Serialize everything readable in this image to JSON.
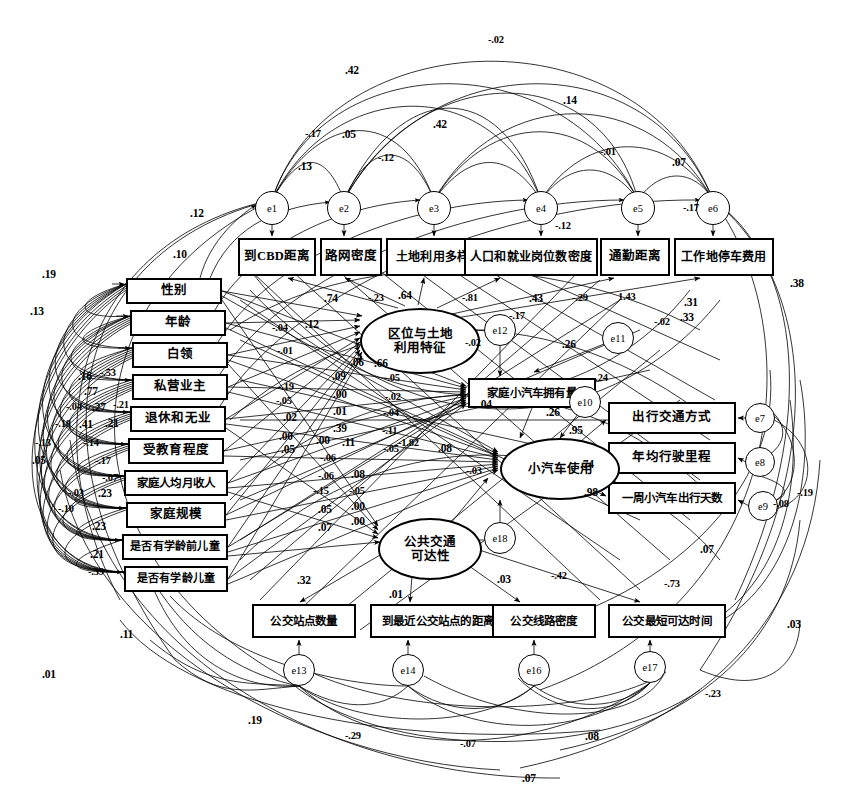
{
  "diagram": {
    "type": "sem-path-diagram",
    "canvas": {
      "width": 845,
      "height": 800
    },
    "stroke_color": "#000000",
    "background_color": "#ffffff"
  },
  "observed_top": [
    {
      "id": "ob1",
      "label": "到CBD距离",
      "x": 238,
      "y": 238,
      "w": 78,
      "h": 38
    },
    {
      "id": "ob2",
      "label": "路网密度",
      "x": 320,
      "y": 238,
      "w": 62,
      "h": 38
    },
    {
      "id": "ob3",
      "label": "土地利用多样性指数",
      "x": 386,
      "y": 238,
      "w": 130,
      "h": 38
    },
    {
      "id": "ob4",
      "label": "人口和就业岗位数密度",
      "x": 464,
      "y": 238,
      "w": 134,
      "h": 38
    },
    {
      "id": "ob5",
      "label": "通勤距离",
      "x": 600,
      "y": 238,
      "w": 70,
      "h": 38
    },
    {
      "id": "ob6",
      "label": "工作地停车费用",
      "x": 674,
      "y": 238,
      "w": 100,
      "h": 38
    }
  ],
  "observed_left": [
    {
      "id": "ol1",
      "label": "性别",
      "x": 126,
      "y": 278,
      "w": 96,
      "h": 26
    },
    {
      "id": "ol2",
      "label": "年龄",
      "x": 130,
      "y": 310,
      "w": 96,
      "h": 26
    },
    {
      "id": "ol3",
      "label": "白领",
      "x": 132,
      "y": 342,
      "w": 96,
      "h": 26
    },
    {
      "id": "ol4",
      "label": "私营业主",
      "x": 132,
      "y": 374,
      "w": 96,
      "h": 26
    },
    {
      "id": "ol5",
      "label": "退休和无业",
      "x": 130,
      "y": 406,
      "w": 96,
      "h": 26
    },
    {
      "id": "ol6",
      "label": "受教育程度",
      "x": 128,
      "y": 438,
      "w": 96,
      "h": 26
    },
    {
      "id": "ol7",
      "label": "家庭人均月收人",
      "x": 124,
      "y": 470,
      "w": 104,
      "h": 26
    },
    {
      "id": "ol8",
      "label": "家庭规模",
      "x": 126,
      "y": 502,
      "w": 100,
      "h": 26
    },
    {
      "id": "ol9",
      "label": "是否有学龄前儿童",
      "x": 122,
      "y": 534,
      "w": 106,
      "h": 26
    },
    {
      "id": "ol10",
      "label": "是否有学龄儿童",
      "x": 124,
      "y": 566,
      "w": 104,
      "h": 26
    }
  ],
  "observed_right": [
    {
      "id": "or1",
      "label": "出行交通方式",
      "x": 608,
      "y": 402,
      "w": 128,
      "h": 32
    },
    {
      "id": "or2",
      "label": "年均行驶里程",
      "x": 608,
      "y": 442,
      "w": 128,
      "h": 32
    },
    {
      "id": "or3",
      "label": "一周小汽车出行天数",
      "x": 608,
      "y": 482,
      "w": 128,
      "h": 32
    }
  ],
  "observed_bottom": [
    {
      "id": "obt1",
      "label": "公交站点数量",
      "x": 252,
      "y": 604,
      "w": 104,
      "h": 34
    },
    {
      "id": "obt2",
      "label": "到最近公交站点的距离",
      "x": 370,
      "y": 604,
      "w": 136,
      "h": 34
    },
    {
      "id": "obt3",
      "label": "公交线路密度",
      "x": 492,
      "y": 604,
      "w": 104,
      "h": 34
    },
    {
      "id": "obt4",
      "label": "公交最短可达时间",
      "x": 608,
      "y": 604,
      "w": 118,
      "h": 34
    }
  ],
  "latents": [
    {
      "id": "lat1",
      "label": "区位与土地\n利用特征",
      "line1": "区位与土地",
      "line2": "利用特征",
      "x": 360,
      "y": 308,
      "w": 120,
      "h": 66
    },
    {
      "id": "lat2",
      "label": "小汽车使用",
      "line1": "小汽车使用",
      "line2": "",
      "x": 500,
      "y": 438,
      "w": 120,
      "h": 62
    },
    {
      "id": "lat3",
      "label": "公共交通\n可达性",
      "line1": "公共交通",
      "line2": "可达性",
      "x": 378,
      "y": 518,
      "w": 104,
      "h": 62
    }
  ],
  "observed_mid": [
    {
      "id": "om1",
      "label": "家庭小汽车拥有量",
      "x": 468,
      "y": 378,
      "w": 128,
      "h": 30
    }
  ],
  "errors": [
    {
      "id": "e1",
      "label": "e1",
      "cx": 272,
      "cy": 208,
      "r": 17
    },
    {
      "id": "e2",
      "label": "e2",
      "cx": 344,
      "cy": 208,
      "r": 17
    },
    {
      "id": "e3",
      "label": "e3",
      "cx": 434,
      "cy": 208,
      "r": 17
    },
    {
      "id": "e4",
      "label": "e4",
      "cx": 541,
      "cy": 208,
      "r": 17
    },
    {
      "id": "e5",
      "label": "e5",
      "cx": 638,
      "cy": 208,
      "r": 17
    },
    {
      "id": "e6",
      "label": "e6",
      "cx": 713,
      "cy": 208,
      "r": 17
    },
    {
      "id": "e7",
      "label": "e7",
      "cx": 760,
      "cy": 418,
      "r": 15
    },
    {
      "id": "e8",
      "label": "e8",
      "cx": 760,
      "cy": 462,
      "r": 15
    },
    {
      "id": "e9",
      "label": "e9",
      "cx": 763,
      "cy": 506,
      "r": 15
    },
    {
      "id": "e10",
      "label": "e10",
      "cx": 585,
      "cy": 402,
      "r": 16
    },
    {
      "id": "e11",
      "label": "e11",
      "cx": 618,
      "cy": 338,
      "r": 16
    },
    {
      "id": "e12",
      "label": "e12",
      "cx": 500,
      "cy": 330,
      "r": 16
    },
    {
      "id": "e13",
      "label": "e13",
      "cx": 299,
      "cy": 670,
      "r": 16
    },
    {
      "id": "e14",
      "label": "e14",
      "cx": 408,
      "cy": 670,
      "r": 16
    },
    {
      "id": "e16",
      "label": "e16",
      "cx": 534,
      "cy": 670,
      "r": 16
    },
    {
      "id": "e17",
      "label": "e17",
      "cx": 650,
      "cy": 667,
      "r": 16
    },
    {
      "id": "e18",
      "label": "e18",
      "cx": 500,
      "cy": 538,
      "r": 16
    }
  ],
  "coefficients": [
    {
      "id": "c_top_n02",
      "value": "-.02",
      "x": 488,
      "y": 34
    },
    {
      "id": "c_top_42a",
      "value": ".42",
      "x": 345,
      "y": 64
    },
    {
      "id": "c_top_14",
      "value": ".14",
      "x": 563,
      "y": 94
    },
    {
      "id": "c_top_n17",
      "value": "-.17",
      "x": 305,
      "y": 128
    },
    {
      "id": "c_top_05",
      "value": ".05",
      "x": 342,
      "y": 128
    },
    {
      "id": "c_top_42b",
      "value": ".42",
      "x": 433,
      "y": 118
    },
    {
      "id": "c_top_n01",
      "value": "-.01",
      "x": 600,
      "y": 146
    },
    {
      "id": "c_top_07",
      "value": ".07",
      "x": 672,
      "y": 156
    },
    {
      "id": "c_top_13",
      "value": ".13",
      "x": 298,
      "y": 160
    },
    {
      "id": "c_top_n12",
      "value": "-.12",
      "x": 378,
      "y": 152
    },
    {
      "id": "c_e6_n17",
      "value": "-.17",
      "x": 683,
      "y": 202
    },
    {
      "id": "c_e4_n12",
      "value": "-.12",
      "x": 555,
      "y": 220
    },
    {
      "id": "c_l_12",
      "value": ".12",
      "x": 190,
      "y": 207
    },
    {
      "id": "c_l_10",
      "value": ".10",
      "x": 173,
      "y": 248
    },
    {
      "id": "c_l_19",
      "value": ".19",
      "x": 42,
      "y": 268
    },
    {
      "id": "c_l_13a",
      "value": ".13",
      "x": 30,
      "y": 305
    },
    {
      "id": "c_r_38",
      "value": ".38",
      "x": 790,
      "y": 277
    },
    {
      "id": "c_r_31",
      "value": ".31",
      "x": 684,
      "y": 296
    },
    {
      "id": "c_r_33",
      "value": ".33",
      "x": 680,
      "y": 311
    },
    {
      "id": "c_74",
      "value": ".74",
      "x": 324,
      "y": 292
    },
    {
      "id": "c_n23",
      "value": "-.23",
      "x": 368,
      "y": 292
    },
    {
      "id": "c_64",
      "value": ".64",
      "x": 398,
      "y": 289
    },
    {
      "id": "c_n81",
      "value": "-.81",
      "x": 462,
      "y": 292
    },
    {
      "id": "c_43",
      "value": ".43",
      "x": 529,
      "y": 292
    },
    {
      "id": "c_n29",
      "value": "-.29",
      "x": 572,
      "y": 292
    },
    {
      "id": "c_143",
      "value": "1.43",
      "x": 618,
      "y": 291
    },
    {
      "id": "c_n17b",
      "value": "-.17",
      "x": 509,
      "y": 310
    },
    {
      "id": "c_n02a",
      "value": "-.02",
      "x": 465,
      "y": 337
    },
    {
      "id": "c_n02b",
      "value": "-.02",
      "x": 654,
      "y": 316
    },
    {
      "id": "c_26a",
      "value": ".26",
      "x": 562,
      "y": 338
    },
    {
      "id": "c_n24",
      "value": "-.24",
      "x": 592,
      "y": 372
    },
    {
      "id": "c_26b",
      "value": ".26",
      "x": 546,
      "y": 406
    },
    {
      "id": "c_04",
      "value": ".04",
      "x": 478,
      "y": 398
    },
    {
      "id": "c_95",
      "value": ".95",
      "x": 569,
      "y": 424
    },
    {
      "id": "c_74b",
      "value": ".74",
      "x": 580,
      "y": 458
    },
    {
      "id": "c_98",
      "value": ".98",
      "x": 584,
      "y": 486
    },
    {
      "id": "c_r_n19",
      "value": "-.19",
      "x": 797,
      "y": 487
    },
    {
      "id": "c_r_n08",
      "value": "-.08",
      "x": 773,
      "y": 498
    },
    {
      "id": "c_n03",
      "value": "-.03",
      "x": 466,
      "y": 465
    },
    {
      "id": "c_03",
      "value": ".03",
      "x": 497,
      "y": 573
    },
    {
      "id": "c_n42",
      "value": "-.42",
      "x": 551,
      "y": 570
    },
    {
      "id": "c_n73",
      "value": "-.73",
      "x": 664,
      "y": 578
    },
    {
      "id": "c_07r",
      "value": ".07",
      "x": 700,
      "y": 543
    },
    {
      "id": "c_32",
      "value": ".32",
      "x": 297,
      "y": 574
    },
    {
      "id": "c_01b",
      "value": ".01",
      "x": 389,
      "y": 588
    },
    {
      "id": "c_11",
      "value": ".11",
      "x": 120,
      "y": 628
    },
    {
      "id": "c_01c",
      "value": ".01",
      "x": 42,
      "y": 668
    },
    {
      "id": "c_19b",
      "value": ".19",
      "x": 248,
      "y": 714
    },
    {
      "id": "c_n29b",
      "value": "-.29",
      "x": 345,
      "y": 730
    },
    {
      "id": "c_n07",
      "value": "-.07",
      "x": 460,
      "y": 738
    },
    {
      "id": "c_08b",
      "value": ".08",
      "x": 585,
      "y": 730
    },
    {
      "id": "c_07b",
      "value": ".07",
      "x": 522,
      "y": 772
    },
    {
      "id": "c_n23b",
      "value": "-.23",
      "x": 705,
      "y": 688
    },
    {
      "id": "c_03b",
      "value": ".03",
      "x": 787,
      "y": 618
    },
    {
      "id": "c_cl_n04",
      "value": "-.04",
      "x": 272,
      "y": 322
    },
    {
      "id": "c_cl_12",
      "value": ".12",
      "x": 305,
      "y": 318
    },
    {
      "id": "c_cl_n01",
      "value": "-.01",
      "x": 277,
      "y": 345
    },
    {
      "id": "c_cl_06",
      "value": ".06",
      "x": 350,
      "y": 356
    },
    {
      "id": "c_cl_66",
      "value": ".66",
      "x": 374,
      "y": 357
    },
    {
      "id": "c_cl_09",
      "value": ".09",
      "x": 332,
      "y": 370
    },
    {
      "id": "c_cl_n05a",
      "value": "-.05",
      "x": 384,
      "y": 372
    },
    {
      "id": "c_cl_n19",
      "value": "-.19",
      "x": 278,
      "y": 381
    },
    {
      "id": "c_cl_n05b",
      "value": "-.05",
      "x": 276,
      "y": 395
    },
    {
      "id": "c_cl_00",
      "value": ".00",
      "x": 333,
      "y": 388
    },
    {
      "id": "c_cl_n02c",
      "value": "-.02",
      "x": 385,
      "y": 391
    },
    {
      "id": "c_cl_02",
      "value": ".02",
      "x": 283,
      "y": 411
    },
    {
      "id": "c_cl_01d",
      "value": ".01",
      "x": 333,
      "y": 405
    },
    {
      "id": "c_cl_n04b",
      "value": "-.04",
      "x": 383,
      "y": 407
    },
    {
      "id": "c_cl_39",
      "value": ".39",
      "x": 333,
      "y": 422
    },
    {
      "id": "c_cl_00b",
      "value": ".00",
      "x": 279,
      "y": 430
    },
    {
      "id": "c_cl_00c",
      "value": ".00",
      "x": 316,
      "y": 434
    },
    {
      "id": "c_cl_11b",
      "value": ".11",
      "x": 342,
      "y": 436
    },
    {
      "id": "c_cl_n11",
      "value": "-.11",
      "x": 382,
      "y": 425
    },
    {
      "id": "c_cl_05a",
      "value": ".05",
      "x": 281,
      "y": 443
    },
    {
      "id": "c_cl_n05c",
      "value": "-.05",
      "x": 383,
      "y": 443
    },
    {
      "id": "c_cl_n182",
      "value": "-1.82",
      "x": 398,
      "y": 437
    },
    {
      "id": "c_cl_08",
      "value": ".08",
      "x": 438,
      "y": 442
    },
    {
      "id": "c_cl_n06",
      "value": "-.06",
      "x": 320,
      "y": 452
    },
    {
      "id": "c_cl_n06b",
      "value": "-.06",
      "x": 318,
      "y": 470
    },
    {
      "id": "c_cl_08b",
      "value": ".08",
      "x": 351,
      "y": 468
    },
    {
      "id": "c_cl_n15",
      "value": "-.15",
      "x": 313,
      "y": 485
    },
    {
      "id": "c_cl_n05d",
      "value": "-.05",
      "x": 349,
      "y": 485
    },
    {
      "id": "c_cl_05b",
      "value": ".05",
      "x": 318,
      "y": 503
    },
    {
      "id": "c_cl_00d",
      "value": ".00",
      "x": 351,
      "y": 500
    },
    {
      "id": "c_cl_00e",
      "value": ".00",
      "x": 351,
      "y": 515
    },
    {
      "id": "c_cl_07",
      "value": ".07",
      "x": 318,
      "y": 521
    },
    {
      "id": "c_ll_16",
      "value": ".16",
      "x": 78,
      "y": 370
    },
    {
      "id": "c_ll_n53",
      "value": "-.53",
      "x": 100,
      "y": 367
    },
    {
      "id": "c_ll_77",
      "value": ".77",
      "x": 84,
      "y": 385
    },
    {
      "id": "c_ll_n04",
      "value": "-.04",
      "x": 66,
      "y": 401
    },
    {
      "id": "c_ll_27",
      "value": ".27",
      "x": 92,
      "y": 401
    },
    {
      "id": "c_ll_n21",
      "value": "-.21",
      "x": 113,
      "y": 399
    },
    {
      "id": "c_ll_n18",
      "value": "-.18",
      "x": 55,
      "y": 418
    },
    {
      "id": "c_ll_41",
      "value": ".41",
      "x": 79,
      "y": 418
    },
    {
      "id": "c_ll_21b",
      "value": ".21",
      "x": 105,
      "y": 417
    },
    {
      "id": "c_ll_n13",
      "value": "-.13",
      "x": 35,
      "y": 437
    },
    {
      "id": "c_ll_n14",
      "value": "-.14",
      "x": 83,
      "y": 437
    },
    {
      "id": "c_ll_05",
      "value": ".05",
      "x": 32,
      "y": 454
    },
    {
      "id": "c_ll_n17",
      "value": "-.17",
      "x": 95,
      "y": 455
    },
    {
      "id": "c_ll_n07",
      "value": "-.07",
      "x": 102,
      "y": 472
    },
    {
      "id": "c_ll_n03",
      "value": "-.03",
      "x": 68,
      "y": 487
    },
    {
      "id": "c_ll_23",
      "value": ".23",
      "x": 98,
      "y": 487
    },
    {
      "id": "c_ll_n10",
      "value": "-.10",
      "x": 58,
      "y": 503
    },
    {
      "id": "c_ll_23b",
      "value": ".23",
      "x": 92,
      "y": 520
    },
    {
      "id": "c_ll_21c",
      "value": ".21",
      "x": 90,
      "y": 548
    },
    {
      "id": "c_ll_n39",
      "value": "-.39",
      "x": 88,
      "y": 566
    }
  ],
  "chart_data": {
    "type": "diagram",
    "latent_variables": [
      "区位与土地利用特征",
      "小汽车使用",
      "公共交通可达性"
    ],
    "endogenous_observed": [
      "家庭小汽车拥有量"
    ],
    "measurement_loadings": [
      {
        "from": "区位与土地利用特征",
        "to": "到CBD距离",
        "value": 0.74
      },
      {
        "from": "区位与土地利用特征",
        "to": "路网密度",
        "value": -0.23
      },
      {
        "from": "区位与土地利用特征",
        "to": "土地利用多样性指数",
        "value": 0.64
      },
      {
        "from": "区位与土地利用特征",
        "to": "人口和就业岗位数密度",
        "value": -0.81
      },
      {
        "from": "区位与土地利用特征",
        "to": "通勤距离",
        "value": 0.43
      },
      {
        "from": "区位与土地利用特征",
        "to": "工作地停车费用",
        "value": -0.29
      },
      {
        "from": "小汽车使用",
        "to": "出行交通方式",
        "value": 0.95
      },
      {
        "from": "小汽车使用",
        "to": "年均行驶里程",
        "value": 0.74
      },
      {
        "from": "小汽车使用",
        "to": "一周小汽车出行天数",
        "value": 0.98
      },
      {
        "from": "公共交通可达性",
        "to": "公交站点数量",
        "value": 0.32
      },
      {
        "from": "公共交通可达性",
        "to": "到最近公交站点的距离",
        "value": 0.01
      },
      {
        "from": "公共交通可达性",
        "to": "公交线路密度",
        "value": 0.03
      },
      {
        "from": "公共交通可达性",
        "to": "公交最短可达时间",
        "value": -0.42
      }
    ],
    "structural_paths": [
      {
        "from": "区位与土地利用特征",
        "to": "家庭小汽车拥有量",
        "value": -0.02
      },
      {
        "from": "家庭小汽车拥有量",
        "to": "小汽车使用",
        "value": 0.26
      },
      {
        "from": "公共交通可达性",
        "to": "小汽车使用",
        "value": -0.03
      },
      {
        "from": "区位与土地利用特征",
        "to": "小汽车使用",
        "value": -1.82
      },
      {
        "from": "区位与土地利用特征",
        "to": "公共交通可达性",
        "value": 1.43
      }
    ]
  }
}
